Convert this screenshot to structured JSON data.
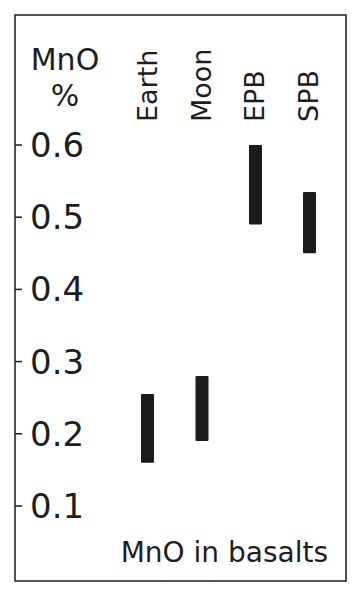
{
  "chart_data": {
    "type": "bar",
    "subtype": "range-bar",
    "title": "MnO in basalts",
    "xlabel": "",
    "ylabel": "MnO\n%",
    "ylabel_lines": [
      "MnO",
      "%"
    ],
    "categories": [
      "Earth",
      "Moon",
      "EPB",
      "SPB"
    ],
    "series": [
      {
        "name": "MnO range",
        "ranges": [
          {
            "category": "Earth",
            "low": 0.16,
            "high": 0.255
          },
          {
            "category": "Moon",
            "low": 0.19,
            "high": 0.28
          },
          {
            "category": "EPB",
            "low": 0.49,
            "high": 0.6
          },
          {
            "category": "SPB",
            "low": 0.45,
            "high": 0.535
          }
        ]
      }
    ],
    "yticks": [
      0.6,
      0.5,
      0.4,
      0.3,
      0.2,
      0.1
    ],
    "ytick_labels": [
      "0.6",
      "0.5",
      "0.4",
      "0.3",
      "0.2",
      "0.1"
    ],
    "ylim": [
      0.05,
      0.7
    ],
    "grid": false,
    "legend": null,
    "bar_color": "#1b1b1b",
    "frame_color": "#2a2a2a"
  },
  "layout": {
    "frame": {
      "x": 15,
      "y": 15,
      "w": 331,
      "h": 566
    },
    "y_map": {
      "ref_value": 0.6,
      "ref_y": 145,
      "px_per_unit": 722
    },
    "bar_width": 13,
    "bar_centers": [
      147.5,
      202,
      255.5,
      309.5
    ],
    "tick_length": 7,
    "tick_label_x": 30,
    "cat_label_baseline_x": [
      157,
      211,
      264,
      318
    ],
    "cat_label_bottom_y": 122,
    "ylabel_x": 65,
    "ylabel_y": [
      70,
      106
    ],
    "title_x": 328,
    "title_y": 562
  }
}
